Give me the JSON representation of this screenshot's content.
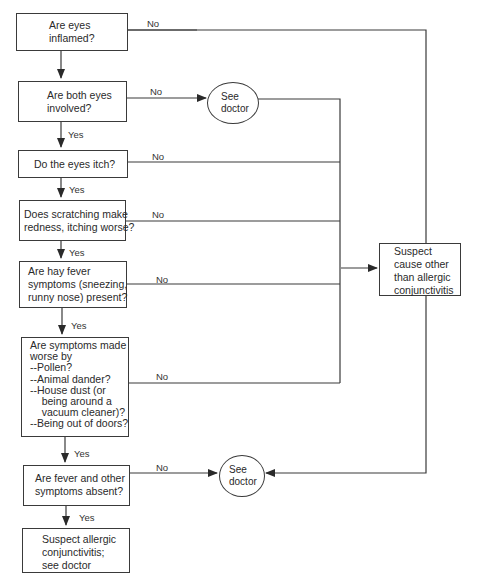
{
  "diagram": {
    "type": "flowchart",
    "nodes": [
      {
        "id": "q1",
        "shape": "rect",
        "text": "Are eyes\ninflamed?"
      },
      {
        "id": "q2",
        "shape": "rect",
        "text": "Are both eyes\ninvolved?"
      },
      {
        "id": "q3",
        "shape": "rect",
        "text": "Do the eyes itch?"
      },
      {
        "id": "q4",
        "shape": "rect",
        "text": "Does scratching make\nredness, itching worse?"
      },
      {
        "id": "q5",
        "shape": "rect",
        "text": "Are hay fever\nsymptoms (sneezing,\nrunny nose) present?"
      },
      {
        "id": "q6",
        "shape": "rect",
        "text": "Are symptoms made\nworse by\n--Pollen?\n--Animal dander?\n--House dust (or\n    being around a\n    vacuum cleaner)?\n--Being out of doors?"
      },
      {
        "id": "q7",
        "shape": "rect",
        "text": "Are fever and other\nsymptoms absent?"
      },
      {
        "id": "r_allergic",
        "shape": "rect",
        "text": "Suspect allergic\nconjunctivitis;\nsee doctor"
      },
      {
        "id": "r_other",
        "shape": "rect",
        "text": "Suspect\ncause other\nthan allergic\nconjunctivitis"
      },
      {
        "id": "doc1",
        "shape": "circle",
        "text": "See\ndoctor"
      },
      {
        "id": "doc2",
        "shape": "circle",
        "text": "See\ndoctor"
      }
    ],
    "edges": [
      {
        "from": "q1",
        "to": "q2",
        "label": ""
      },
      {
        "from": "q1",
        "to": "r_other",
        "label": "No"
      },
      {
        "from": "q2",
        "to": "q3",
        "label": "Yes"
      },
      {
        "from": "q2",
        "to": "doc1",
        "label": "No"
      },
      {
        "from": "doc1",
        "to": "r_other",
        "label": ""
      },
      {
        "from": "q3",
        "to": "q4",
        "label": "Yes"
      },
      {
        "from": "q3",
        "to": "r_other",
        "label": "No"
      },
      {
        "from": "q4",
        "to": "q5",
        "label": "Yes"
      },
      {
        "from": "q4",
        "to": "r_other",
        "label": "No"
      },
      {
        "from": "q5",
        "to": "q6",
        "label": "Yes"
      },
      {
        "from": "q5",
        "to": "r_other",
        "label": "No"
      },
      {
        "from": "q6",
        "to": "q7",
        "label": "Yes"
      },
      {
        "from": "q6",
        "to": "r_other",
        "label": "No"
      },
      {
        "from": "q7",
        "to": "r_allergic",
        "label": "Yes"
      },
      {
        "from": "q7",
        "to": "doc2",
        "label": "No"
      },
      {
        "from": "r_other",
        "to": "doc2",
        "label": ""
      }
    ]
  },
  "labels": {
    "yes": "Yes",
    "no": "No"
  }
}
